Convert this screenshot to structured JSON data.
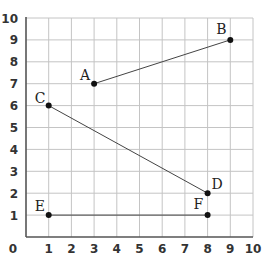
{
  "chart_data": {
    "type": "scatter",
    "title": "",
    "xlabel": "",
    "ylabel": "",
    "xlim": [
      0,
      10
    ],
    "ylim": [
      0,
      10
    ],
    "grid": true,
    "x_ticks": [
      "0",
      "1",
      "2",
      "3",
      "4",
      "5",
      "6",
      "7",
      "8",
      "9",
      "10"
    ],
    "y_ticks": [
      "1",
      "2",
      "3",
      "4",
      "5",
      "6",
      "7",
      "8",
      "9",
      "10"
    ],
    "points": [
      {
        "label": "A",
        "x": 3,
        "y": 7
      },
      {
        "label": "B",
        "x": 9,
        "y": 9
      },
      {
        "label": "C",
        "x": 1,
        "y": 6
      },
      {
        "label": "D",
        "x": 8,
        "y": 2
      },
      {
        "label": "E",
        "x": 1,
        "y": 1
      },
      {
        "label": "F",
        "x": 8,
        "y": 1
      }
    ],
    "segments": [
      {
        "name": "AB",
        "from": "A",
        "to": "B"
      },
      {
        "name": "CD",
        "from": "C",
        "to": "D"
      },
      {
        "name": "EF",
        "from": "E",
        "to": "F"
      }
    ],
    "legend": null
  },
  "colors": {
    "grid": "#c4c4c4",
    "axis": "#555555",
    "segment": "#444444",
    "point": "#111111",
    "text": "#333333"
  }
}
